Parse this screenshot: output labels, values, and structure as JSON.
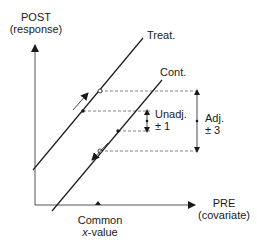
{
  "axes": {
    "y_label_line1": "POST",
    "y_label_line2": "(response)",
    "x_label_line1": "PRE",
    "x_label_line2": "(covariate)",
    "x_marker_line1": "Common",
    "x_marker_var": "x",
    "x_marker_rest": "-value"
  },
  "lines": {
    "treatment_label": "Treat.",
    "control_label": "Cont."
  },
  "annotations": {
    "unadj_label": "Unadj.",
    "unadj_value": "± 1",
    "adj_label": "Adj.",
    "adj_value": "± 3"
  },
  "colors": {
    "line": "#1a1a1a",
    "axis": "#555555",
    "dashed": "#666666"
  }
}
